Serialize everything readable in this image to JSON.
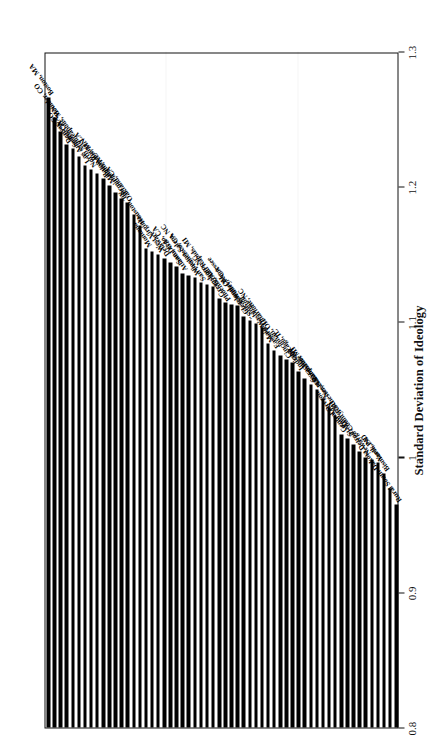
{
  "figure": {
    "orientation": "rotated-90-ccw",
    "axis_title": "Standard Deviation of Ideology",
    "tick_labels": [
      "0.8",
      "0.9",
      "1",
      "1.1",
      "1.2",
      "1.3"
    ]
  },
  "chart_data": {
    "type": "bar",
    "title": "",
    "subtitle": "",
    "xlabel": "Standard Deviation of Ideology",
    "ylabel": "",
    "orientation": "horizontal",
    "xlim": [
      0.8,
      1.3
    ],
    "grid": false,
    "legend": null,
    "ticks": [
      0.8,
      0.9,
      1.0,
      1.1,
      1.2,
      1.3
    ],
    "tick_labels": [
      "0.8",
      "0.9",
      "1",
      "1.1",
      "1.2",
      "1.3"
    ],
    "baseline": 0.8,
    "categories": [
      "Boston, MA",
      "Boulder, CO",
      "Denver, CO",
      "Seattle, WA",
      "Los Angeles, CA",
      "North Minneapolis, MN",
      "Baton Rouge, LA",
      "Minneapolis, MN",
      "Birmingham, AL",
      "Oakland, CA",
      "Houston, TX",
      "Montana",
      "West Virginia",
      "Delaware",
      "San Diego, CA",
      "Atlanta, GA",
      "Winston-Salem, NC",
      "San Francisco, CA",
      "Grand Rapids, MI",
      "Greensboro, NC",
      "Phoenix, AZ",
      "Eastern Tennessee",
      "Cleveland, OH",
      "\"Silicon Valley,\" CA",
      "Charlotte, NC",
      "Maine",
      "Eastern Washington",
      "Cincinnati, OH",
      "Chicago, IL",
      "Indiana",
      "Syracuse, NY",
      "Kalamazoo, MI",
      "New Hampshire",
      "Rochester, NY",
      "Central Oregon",
      "St. Paul, MN",
      "Detroit, MI",
      "Newaygo County, MI",
      "York, PA",
      "Bismarck, ND",
      "Rural South Dakota"
    ],
    "values": [
      1.266,
      1.251,
      1.231,
      1.228,
      1.216,
      1.213,
      1.206,
      1.201,
      1.191,
      1.188,
      1.171,
      1.154,
      1.15,
      1.147,
      1.141,
      1.136,
      1.133,
      1.129,
      1.126,
      1.117,
      1.114,
      1.112,
      1.104,
      1.101,
      1.096,
      1.084,
      1.079,
      1.072,
      1.07,
      1.063,
      1.054,
      1.05,
      1.043,
      1.031,
      1.017,
      1.014,
      1.004,
      1.0,
      0.996,
      0.988,
      0.965
    ],
    "unlabeled_bar_count": 17,
    "unlabeled_note": "Additional unlabeled bars are interleaved across the distribution in the scan.",
    "bar_color": "#000000",
    "background_color": "#ffffff"
  }
}
